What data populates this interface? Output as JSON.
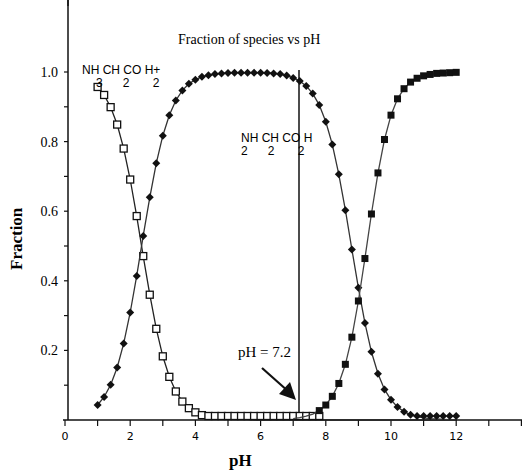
{
  "chart_data": {
    "type": "scatter",
    "title": "Fraction of species vs pH",
    "xlabel": "pH",
    "ylabel": "Fraction",
    "xlim": [
      0,
      14
    ],
    "ylim": [
      0,
      1.05
    ],
    "x_ticks": [
      "0",
      "2",
      "4",
      "6",
      "8",
      "10",
      "12"
    ],
    "y_ticks": [
      "0.2",
      "0.4",
      "0.6",
      "0.8",
      "1.0"
    ],
    "grid": false,
    "pKa": [
      2.35,
      9.78
    ],
    "x": [
      1.0,
      1.2,
      1.4,
      1.6,
      1.8,
      2.0,
      2.2,
      2.4,
      2.6,
      2.8,
      3.0,
      3.2,
      3.4,
      3.6,
      3.8,
      4.0,
      4.2,
      4.4,
      4.6,
      4.8,
      5.0,
      5.2,
      5.4,
      5.6,
      5.8,
      6.0,
      6.2,
      6.4,
      6.6,
      6.8,
      7.0,
      7.2,
      7.4,
      7.6,
      7.8,
      8.0,
      8.2,
      8.4,
      8.6,
      8.8,
      9.0,
      9.2,
      9.4,
      9.6,
      9.8,
      10.0,
      10.2,
      10.4,
      10.6,
      10.8,
      11.0,
      11.2,
      11.4,
      11.6,
      11.8,
      12.0
    ],
    "series": [
      {
        "name": "NH3CH2CO2H+",
        "marker": "open-square",
        "values": [
          0.957,
          0.934,
          0.899,
          0.849,
          0.78,
          0.691,
          0.586,
          0.471,
          0.36,
          0.262,
          0.183,
          0.124,
          0.082,
          0.053,
          0.034,
          0.022,
          0.014,
          0.009,
          0.006,
          0.004,
          0.002,
          0.001,
          0.001,
          0.001,
          0.0,
          0.0,
          0.0,
          0.0,
          0.0,
          0.0,
          0.0,
          0.0,
          0.0,
          0.0,
          0.0,
          0.0,
          0.0,
          0.0,
          0.0,
          0.0,
          0.0,
          0.0,
          0.0,
          0.0,
          0.0,
          0.0,
          0.0,
          0.0,
          0.0,
          0.0,
          0.0,
          0.0,
          0.0,
          0.0,
          0.0,
          0.0
        ]
      },
      {
        "name": "NH2CH2CO2H (zwitterion)",
        "marker": "filled-diamond",
        "values": [
          0.043,
          0.066,
          0.101,
          0.151,
          0.22,
          0.309,
          0.414,
          0.529,
          0.64,
          0.738,
          0.817,
          0.876,
          0.918,
          0.947,
          0.966,
          0.978,
          0.986,
          0.991,
          0.994,
          0.996,
          0.997,
          0.998,
          0.998,
          0.998,
          0.998,
          0.998,
          0.997,
          0.996,
          0.994,
          0.99,
          0.983,
          0.974,
          0.96,
          0.938,
          0.905,
          0.857,
          0.792,
          0.706,
          0.603,
          0.49,
          0.38,
          0.279,
          0.196,
          0.133,
          0.088,
          0.058,
          0.037,
          0.024,
          0.015,
          0.01,
          0.006,
          0.004,
          0.003,
          0.002,
          0.001,
          0.001
        ]
      },
      {
        "name": "NH2CH2CO2-",
        "marker": "filled-square",
        "values": [
          0.0,
          0.0,
          0.0,
          0.0,
          0.0,
          0.0,
          0.0,
          0.0,
          0.0,
          0.0,
          0.0,
          0.0,
          0.0,
          0.0,
          0.0,
          0.0,
          0.0,
          0.0,
          0.0,
          0.0,
          0.0,
          0.0,
          0.0,
          0.0,
          0.0,
          0.0,
          0.0,
          0.0,
          0.0,
          0.0,
          0.004,
          0.007,
          0.011,
          0.017,
          0.027,
          0.043,
          0.068,
          0.105,
          0.16,
          0.238,
          0.342,
          0.464,
          0.592,
          0.71,
          0.806,
          0.876,
          0.923,
          0.952,
          0.971,
          0.982,
          0.989,
          0.993,
          0.996,
          0.997,
          0.998,
          0.999
        ]
      }
    ],
    "annotations": [
      {
        "text": "NH3CH2CO2H+",
        "x": 0.6,
        "y": 1.0
      },
      {
        "text": "NH2CH2CO2H",
        "x": 5.4,
        "y": 0.78
      },
      {
        "text": "pH = 7.2",
        "x": 6.0,
        "y": 0.2,
        "arrow_to": [
          7.2,
          0.0
        ]
      }
    ],
    "vertical_line_x": 7.2
  },
  "labels": {
    "title": "Fraction of species vs pH",
    "xlabel": "pH",
    "ylabel": "Fraction",
    "species1_main": "NH CH CO H+",
    "species1_sub": "3      2       2",
    "species2_main": "NH CH CO H",
    "species2_sub": "2      2       2",
    "ph_annotation": "pH = 7.2"
  }
}
